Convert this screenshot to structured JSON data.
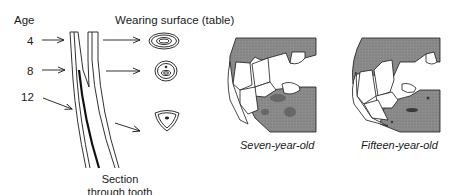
{
  "left_panel": {
    "age_header": "Age",
    "surface_header": "Wearing surface (table)",
    "ages": [
      "4",
      "8",
      "12"
    ],
    "section_caption_line1": "Section",
    "section_caption_line2": "through tooth",
    "surfaces": [
      {
        "age": "4",
        "shape": "oval-rings"
      },
      {
        "age": "8",
        "shape": "rounded-rings-with-dot"
      },
      {
        "age": "12",
        "shape": "triangular-ring-with-dot"
      }
    ]
  },
  "right_panel": {
    "jaws": [
      {
        "caption": "Seven-year-old"
      },
      {
        "caption": "Fifteen-year-old"
      }
    ]
  },
  "colors": {
    "ink": "#1a1a1a",
    "gum_shading": "#8a8a8a",
    "gum_dark": "#5a5a5a",
    "background": "#ffffff"
  }
}
